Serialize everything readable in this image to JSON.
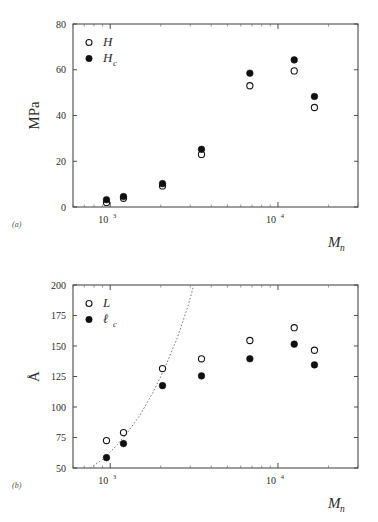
{
  "figure": {
    "panels": [
      {
        "id": "a",
        "panel_label": "(a)",
        "ylabel": "MPa",
        "xlabel": "M",
        "xlabel_sub": "n",
        "legend": [
          {
            "marker": "open-circle",
            "label": "H",
            "sub": ""
          },
          {
            "marker": "filled-circle",
            "label": "H",
            "sub": "c"
          }
        ]
      },
      {
        "id": "b",
        "panel_label": "(b)",
        "ylabel": "Å",
        "xlabel": "M",
        "xlabel_sub": "n",
        "legend": [
          {
            "marker": "open-circle",
            "label": "L",
            "sub": ""
          },
          {
            "marker": "filled-circle",
            "label": "ℓ",
            "sub": "c"
          }
        ]
      }
    ]
  },
  "chart_data": [
    {
      "type": "scatter",
      "id": "panel-a",
      "title": "",
      "xlabel": "Mn",
      "ylabel": "MPa",
      "xscale": "log",
      "xlim": [
        600,
        30000
      ],
      "ylim": [
        0,
        80
      ],
      "yticks": [
        0,
        20,
        40,
        60,
        80
      ],
      "ytick_labels": [
        "0",
        "20",
        "40",
        "60",
        "80"
      ],
      "xticks": [
        1000,
        10000
      ],
      "xtick_labels": [
        "10^3",
        "10^4"
      ],
      "grid": false,
      "legend_position": "upper-left",
      "series": [
        {
          "name": "H",
          "marker": "open-circle",
          "x": [
            950,
            1200,
            2050,
            3500,
            6800,
            12500,
            16500
          ],
          "y": [
            2.0,
            3.8,
            9.2,
            23.0,
            53.0,
            59.5,
            43.5
          ]
        },
        {
          "name": "Hc",
          "marker": "filled-circle",
          "x": [
            950,
            1200,
            2050,
            3500,
            6800,
            12500,
            16500
          ],
          "y": [
            3.2,
            4.6,
            10.2,
            25.2,
            58.5,
            64.3,
            48.3
          ]
        }
      ]
    },
    {
      "type": "scatter",
      "id": "panel-b",
      "title": "",
      "xlabel": "Mn",
      "ylabel": "Å",
      "xscale": "log",
      "xlim": [
        600,
        30000
      ],
      "ylim": [
        50,
        200
      ],
      "yticks": [
        50,
        75,
        100,
        125,
        150,
        175,
        200
      ],
      "ytick_labels": [
        "50",
        "75",
        "100",
        "125",
        "150",
        "175",
        "200"
      ],
      "xticks": [
        1000,
        10000
      ],
      "xtick_labels": [
        "10^3",
        "10^4"
      ],
      "grid": false,
      "legend_position": "upper-left",
      "series": [
        {
          "name": "L",
          "marker": "open-circle",
          "x": [
            950,
            1200,
            2050,
            3500,
            6800,
            12500,
            16500
          ],
          "y": [
            72.5,
            79.0,
            131.5,
            139.5,
            154.5,
            165.0,
            146.5
          ]
        },
        {
          "name": "lc",
          "marker": "filled-circle",
          "x": [
            950,
            1200,
            2050,
            3500,
            6800,
            12500,
            16500
          ],
          "y": [
            58.5,
            70.0,
            117.5,
            125.5,
            139.5,
            151.5,
            134.5
          ]
        }
      ],
      "annotations": [
        {
          "type": "dashed-curve",
          "name": "extended-chain-line",
          "x": [
            760,
            900,
            1050,
            1250,
            1500,
            1800,
            2100,
            2500,
            2900,
            3150
          ],
          "y": [
            50.0,
            57.0,
            66.0,
            78.0,
            93.0,
            112.0,
            131.0,
            156.0,
            182.0,
            200.0
          ]
        }
      ]
    }
  ]
}
